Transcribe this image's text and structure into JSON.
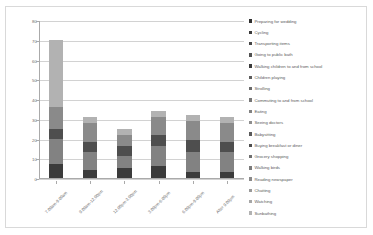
{
  "chart_data": {
    "type": "bar",
    "stacked": true,
    "title": "",
    "xlabel": "",
    "ylabel": "",
    "ylim": [
      0,
      80
    ],
    "ytick_step": 10,
    "ytick_labels": [
      "0",
      "10",
      "20",
      "30",
      "40",
      "50",
      "60",
      "70",
      "80"
    ],
    "grid": true,
    "legend_position": "right",
    "categories": [
      "7.00am-9.00am",
      "9.00am-12.00pm",
      "12.00pm-3.00pm",
      "3.00pm-6.00pm",
      "6.00pm-9.00pm",
      "After 9.00pm"
    ],
    "series": [
      {
        "name": "Preparing for wedding",
        "color": "#2f2f2f",
        "values": [
          0,
          0,
          0,
          0,
          0,
          0
        ]
      },
      {
        "name": "Cycling",
        "color": "#3a3a3a",
        "values": [
          0,
          0,
          0,
          0,
          0,
          0
        ]
      },
      {
        "name": "Transporting items",
        "color": "#454545",
        "values": [
          0,
          0,
          0,
          0,
          0,
          0
        ]
      },
      {
        "name": "Going to public bath",
        "color": "#515151",
        "values": [
          0,
          0,
          0,
          0,
          0,
          0
        ]
      },
      {
        "name": "Walking children to and from school",
        "color": "#3b3b3b",
        "values": [
          7,
          4,
          5,
          6,
          3,
          3
        ]
      },
      {
        "name": "Children playing",
        "color": "#5d5d5d",
        "values": [
          0,
          0,
          0,
          0,
          0,
          0
        ]
      },
      {
        "name": "Strolling",
        "color": "#6a6a6a",
        "values": [
          0,
          0,
          0,
          0,
          0,
          0
        ]
      },
      {
        "name": "Commuting to and from school",
        "color": "#767676",
        "values": [
          0,
          0,
          0,
          0,
          0,
          0
        ]
      },
      {
        "name": "Eating",
        "color": "#828282",
        "values": [
          13,
          9,
          6,
          10,
          10,
          10
        ]
      },
      {
        "name": "Seeing doctors",
        "color": "#8e8e8e",
        "values": [
          0,
          0,
          0,
          0,
          0,
          0
        ]
      },
      {
        "name": "Babysitting",
        "color": "#5a5a5a",
        "values": [
          0,
          0,
          0,
          0,
          0,
          0
        ]
      },
      {
        "name": "Buying breakfast or diner",
        "color": "#4e4e4e",
        "values": [
          5,
          5,
          5,
          6,
          6,
          5
        ]
      },
      {
        "name": "Grocery shopping",
        "color": "#6f6f6f",
        "values": [
          0,
          0,
          0,
          0,
          0,
          0
        ]
      },
      {
        "name": "Walking birds",
        "color": "#7b7b7b",
        "values": [
          0,
          0,
          0,
          0,
          0,
          0
        ]
      },
      {
        "name": "Reading newspaper",
        "color": "#8a8a8a",
        "values": [
          11,
          10,
          6,
          9,
          10,
          10
        ]
      },
      {
        "name": "Chatting",
        "color": "#9a9a9a",
        "values": [
          0,
          0,
          0,
          0,
          0,
          0
        ]
      },
      {
        "name": "Watching",
        "color": "#a6a6a6",
        "values": [
          0,
          0,
          0,
          0,
          0,
          0
        ]
      },
      {
        "name": "Sunbathing",
        "color": "#b2b2b2",
        "values": [
          34,
          3,
          3,
          3,
          3,
          3
        ]
      }
    ],
    "totals": [
      70,
      31,
      25,
      34,
      32,
      31
    ]
  }
}
